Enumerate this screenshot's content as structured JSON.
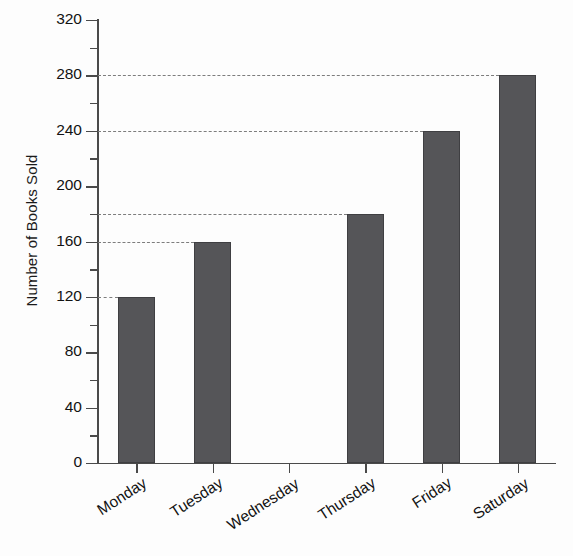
{
  "chart_data": {
    "type": "bar",
    "title": "",
    "xlabel": "",
    "ylabel": "Number of Books Sold",
    "categories": [
      "Monday",
      "Tuesday",
      "Wednesday",
      "Thursday",
      "Friday",
      "Saturday"
    ],
    "values": [
      120,
      160,
      0,
      180,
      240,
      280
    ],
    "ylim": [
      0,
      320
    ],
    "ytick_labels": [
      "0",
      "40",
      "80",
      "120",
      "160",
      "200",
      "240",
      "280",
      "320"
    ],
    "ytick_values": [
      0,
      40,
      80,
      120,
      160,
      200,
      240,
      280,
      320
    ],
    "yminor_tick_values": [
      20,
      60,
      100,
      140,
      180,
      220,
      260,
      300
    ],
    "gridlines": [
      120,
      160,
      180,
      240,
      280
    ],
    "grid": "dashed-value-indicators",
    "legend": "none",
    "bar_color": "#555558",
    "bar_edge_color": "#3f3f42",
    "axis_color": "#4a4a4a",
    "gridline_color": "#7d7d7d",
    "text_color": "#121212",
    "background_color": "#fdfdfd",
    "xtick_label_rotation": -33
  }
}
